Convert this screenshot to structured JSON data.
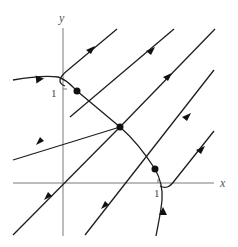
{
  "diagram": {
    "type": "phase-portrait",
    "axes": {
      "x_label": "x",
      "y_label": "y",
      "x_tick": "1",
      "y_tick": "1"
    },
    "equilibria": [
      {
        "name": "equilibrium-upper",
        "px": [
          77,
          91
        ]
      },
      {
        "name": "equilibrium-middle",
        "px": [
          120,
          127
        ]
      },
      {
        "name": "equilibrium-lower",
        "px": [
          155,
          169
        ]
      }
    ],
    "colors": {
      "curve": "#1e1e1e",
      "axis": "#7a7a7a",
      "dot": "#111111"
    }
  }
}
